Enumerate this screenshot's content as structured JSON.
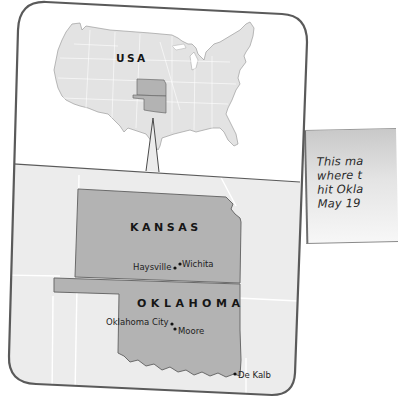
{
  "inset_map": {
    "country_label": "USA",
    "highlighted_states": [
      "Kansas",
      "Oklahoma"
    ]
  },
  "detail_map": {
    "states": [
      {
        "name": "KANSAS"
      },
      {
        "name": "OKLAHOMA"
      }
    ],
    "cities": [
      {
        "name": "Haysville",
        "state": "Kansas"
      },
      {
        "name": "Wichita",
        "state": "Kansas"
      },
      {
        "name": "Oklahoma City",
        "state": "Oklahoma"
      },
      {
        "name": "Moore",
        "state": "Oklahoma"
      },
      {
        "name": "De Kalb",
        "state": "Oklahoma"
      }
    ]
  },
  "caption": {
    "text": "This ma\nwhere t\nhit Okla\nMay 19"
  },
  "colors": {
    "land": "#e3e3e3",
    "highlight": "#b3b3b3",
    "frame": "#5a5a5a",
    "lower_panel": "#ececec"
  }
}
